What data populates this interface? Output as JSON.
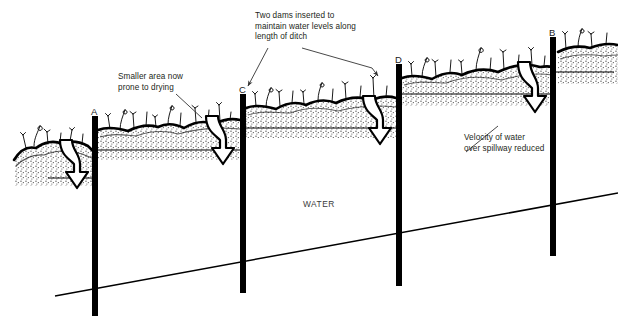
{
  "diagram": {
    "background_color": "#ffffff",
    "ink_color": "#000000",
    "annotations": [
      {
        "id": "smaller-area",
        "text": "Smaller area now\nprone to drying",
        "x": 118,
        "y": 72
      },
      {
        "id": "two-dams",
        "text": "Two dams inserted to\nmaintain water levels along\nlength of ditch",
        "x": 255,
        "y": 11
      },
      {
        "id": "velocity",
        "text": "Velocity of water\nover spillway reduced",
        "x": 464,
        "y": 133
      }
    ],
    "water_label": {
      "text": "WATER",
      "x": 303,
      "y": 199
    },
    "posts": [
      {
        "label": "A",
        "x": 92,
        "label_x": 91,
        "label_y": 106,
        "top": 116,
        "bottom": 316,
        "width": 6
      },
      {
        "label": "C",
        "x": 240,
        "label_x": 239,
        "label_y": 84,
        "top": 94,
        "bottom": 293,
        "width": 6
      },
      {
        "label": "D",
        "x": 396,
        "label_x": 395,
        "label_y": 54,
        "top": 64,
        "bottom": 286,
        "width": 6
      },
      {
        "label": "B",
        "x": 550,
        "label_x": 549,
        "label_y": 27,
        "top": 37,
        "bottom": 256,
        "width": 6
      }
    ],
    "water_levels": [
      {
        "id": "level-before-a",
        "x1": 48,
        "x2": 95,
        "y": 178
      },
      {
        "id": "level-a-to-c",
        "x1": 95,
        "x2": 243,
        "y": 150
      },
      {
        "id": "level-c-to-d",
        "x1": 243,
        "x2": 399,
        "y": 128
      },
      {
        "id": "level-d-to-b",
        "x1": 399,
        "x2": 553,
        "y": 94
      },
      {
        "id": "level-after-b",
        "x1": 553,
        "x2": 612,
        "y": 72
      }
    ],
    "ditch_bottom": {
      "x1": 55,
      "y1": 296,
      "x2": 618,
      "y2": 193
    },
    "flow_arrows": [
      {
        "id": "arrow-over-a",
        "x": 58,
        "y": 138,
        "w": 38,
        "h": 48
      },
      {
        "id": "arrow-over-c",
        "x": 204,
        "y": 114,
        "w": 38,
        "h": 48
      },
      {
        "id": "arrow-over-d",
        "x": 361,
        "y": 94,
        "w": 38,
        "h": 48
      },
      {
        "id": "arrow-over-b",
        "x": 516,
        "y": 60,
        "w": 38,
        "h": 50
      }
    ],
    "leader_lines": [
      {
        "id": "leader-smaller-area",
        "points": "176,94 200,114"
      },
      {
        "id": "leader-two-dams-left",
        "points": "262,47 246,88"
      },
      {
        "id": "leader-two-dams-right",
        "points": "300,47 378,72"
      },
      {
        "id": "leader-velocity",
        "points": "498,128 463,155"
      }
    ]
  }
}
